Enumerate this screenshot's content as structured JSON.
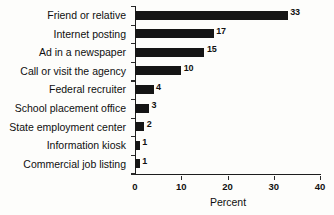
{
  "chart_data": {
    "type": "bar",
    "orientation": "horizontal",
    "title": "",
    "xlabel": "Percent",
    "ylabel": "",
    "categories": [
      "Friend or relative",
      "Internet posting",
      "Ad in a newspaper",
      "Call or visit the agency",
      "Federal recruiter",
      "School placement office",
      "State employment center",
      "Information kiosk",
      "Commercial job listing"
    ],
    "values": [
      33,
      17,
      15,
      10,
      4,
      3,
      2,
      1,
      1
    ],
    "data_labels": [
      "33",
      "17",
      "15",
      "10",
      "4",
      "3",
      "2",
      "1",
      "1"
    ],
    "xlim": [
      0,
      40
    ],
    "xticks": [
      0,
      10,
      20,
      30,
      40
    ],
    "xtick_labels": [
      "0",
      "10",
      "20",
      "30",
      "40"
    ],
    "grid": false,
    "legend": null,
    "bar_color": "#151515",
    "background_color": "#fdfdfb",
    "axis_color": "#1d1d1d"
  }
}
